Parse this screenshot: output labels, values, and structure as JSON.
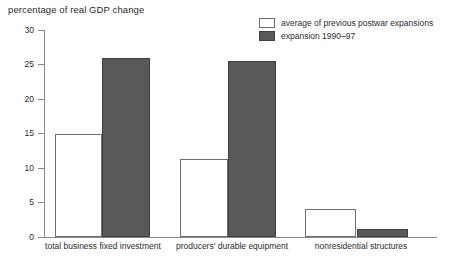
{
  "chart_data": {
    "type": "bar",
    "title": "percentage of real GDP change",
    "xlabel": "",
    "ylabel": "",
    "ylim": [
      0,
      30
    ],
    "yticks": [
      0,
      5,
      10,
      15,
      20,
      25,
      30
    ],
    "ytick_labels": [
      "0",
      "5",
      "10",
      "15",
      "20",
      "25",
      "30"
    ],
    "grid": false,
    "legend_position": "top-right",
    "categories": [
      "total business fixed investment",
      "producers' durable equipment",
      "nonresidential structures"
    ],
    "series": [
      {
        "name": "average of previous postwar expansions",
        "color": "#ffffff",
        "edge_color": "#6e6e6e",
        "values": [
          14.9,
          11.3,
          4.1
        ]
      },
      {
        "name": "expansion 1990–97",
        "color": "#595959",
        "edge_color": "#3f3f3f",
        "values": [
          26.0,
          25.5,
          1.1
        ]
      }
    ]
  },
  "axis": {
    "line_color": "#8a8a8a"
  }
}
